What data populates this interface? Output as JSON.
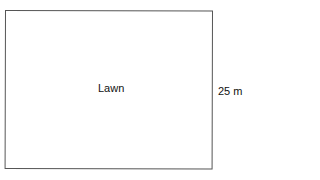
{
  "diagram": {
    "shape": "rectangle",
    "region_label": "Lawn",
    "dimensions": {
      "right_side": "25 m"
    },
    "colors": {
      "border": "#555555",
      "text": "#111111",
      "background": "#ffffff"
    }
  }
}
